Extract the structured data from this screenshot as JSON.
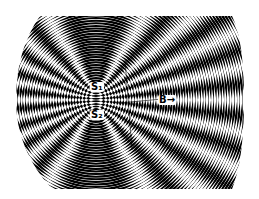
{
  "figure": {
    "colors": {
      "background": "#ffffff",
      "ink": "#000000"
    },
    "sources": [
      {
        "id": "S1",
        "label": "S₁",
        "cx": 96,
        "cy": 88
      },
      {
        "id": "S2",
        "label": "S₂",
        "cx": 96,
        "cy": 112
      }
    ],
    "ring_spacing": 5.2,
    "ring_count": 34,
    "point_label": {
      "text": "B",
      "arrow": "→"
    }
  }
}
